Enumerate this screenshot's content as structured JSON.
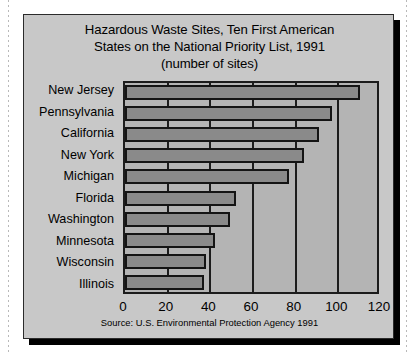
{
  "figure": {
    "title_lines": [
      "Hazardous Waste Sites, Ten First American",
      "States on the National Priority List, 1991",
      "(number of sites)"
    ],
    "source_note": "Source: U.S. Environmental Protection Agency 1991",
    "colors": {
      "card_background": "#c8c8c8",
      "plot_background": "#b4b4b4",
      "bar_fill": "#8a8a8a",
      "bar_border": "#141414",
      "axis": "#1c1c1c",
      "text": "#000000",
      "shadow": "#000000"
    }
  },
  "chart_data": {
    "type": "bar",
    "orientation": "horizontal",
    "title": "Hazardous Waste Sites, Ten First American States on the National Priority List, 1991 (number of sites)",
    "xlabel": "",
    "ylabel": "",
    "categories": [
      "New Jersey",
      "Pennsylvania",
      "California",
      "New York",
      "Michigan",
      "Florida",
      "Washington",
      "Minnesota",
      "Wisconsin",
      "Illinois"
    ],
    "values": [
      110,
      97,
      91,
      84,
      77,
      52,
      49,
      42,
      38,
      37
    ],
    "xlim": [
      0,
      120
    ],
    "xticks": [
      0,
      20,
      40,
      60,
      80,
      100,
      120
    ],
    "xtick_labels": [
      "0",
      "20",
      "40",
      "60",
      "80",
      "100",
      "120"
    ],
    "grid": "vertical",
    "legend": "none",
    "annotations": [
      "Source: U.S. Environmental Protection Agency 1991"
    ]
  }
}
